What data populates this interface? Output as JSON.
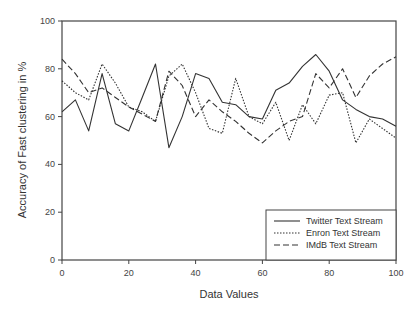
{
  "chart_data": {
    "type": "line",
    "title": "",
    "xlabel": "Data Values",
    "ylabel": "Accuracy of Fast clustering in %",
    "xlim": [
      0,
      100
    ],
    "ylim": [
      0,
      100
    ],
    "xticks": [
      0,
      20,
      40,
      60,
      80,
      100
    ],
    "yticks": [
      0,
      20,
      40,
      60,
      80,
      100
    ],
    "grid": false,
    "legend_position": "lower right",
    "series": [
      {
        "name": "Twitter Text Stream",
        "style": "solid",
        "x": [
          0,
          4,
          8,
          12,
          16,
          20,
          24,
          28,
          32,
          36,
          40,
          44,
          48,
          52,
          56,
          60,
          64,
          68,
          72,
          76,
          80,
          84,
          88,
          92,
          96,
          100
        ],
        "y": [
          62,
          67,
          54,
          78,
          57,
          54,
          68,
          82,
          47,
          60,
          78,
          76,
          66,
          65,
          60,
          59,
          71,
          74,
          81,
          86,
          79,
          67,
          63,
          60,
          59,
          56
        ]
      },
      {
        "name": "Enron Text Stream",
        "style": "dotted",
        "x": [
          0,
          4,
          8,
          12,
          16,
          20,
          24,
          28,
          32,
          36,
          40,
          44,
          48,
          52,
          56,
          60,
          64,
          68,
          72,
          76,
          80,
          84,
          88,
          92,
          96,
          100
        ],
        "y": [
          75,
          70,
          67,
          82,
          74,
          64,
          62,
          58,
          77,
          82,
          70,
          55,
          53,
          76,
          60,
          57,
          66,
          50,
          65,
          57,
          69,
          70,
          49,
          59,
          55,
          51
        ]
      },
      {
        "name": "IMdB Text Stream",
        "style": "dashed",
        "x": [
          0,
          4,
          8,
          12,
          16,
          20,
          24,
          28,
          32,
          36,
          40,
          44,
          48,
          52,
          56,
          60,
          64,
          68,
          72,
          76,
          80,
          84,
          88,
          92,
          96,
          100
        ],
        "y": [
          84,
          78,
          70,
          72,
          68,
          64,
          61,
          58,
          79,
          73,
          60,
          67,
          62,
          58,
          53,
          49,
          54,
          58,
          60,
          78,
          72,
          80,
          68,
          77,
          82,
          85
        ]
      }
    ]
  },
  "legend": {
    "items": [
      {
        "label": "Twitter Text Stream",
        "style": "solid"
      },
      {
        "label": "Enron Text Stream",
        "style": "dotted"
      },
      {
        "label": "IMdB Text Stream",
        "style": "dashed"
      }
    ]
  },
  "colors": {
    "line": "#333333",
    "axis": "#444444",
    "background": "#ffffff"
  }
}
